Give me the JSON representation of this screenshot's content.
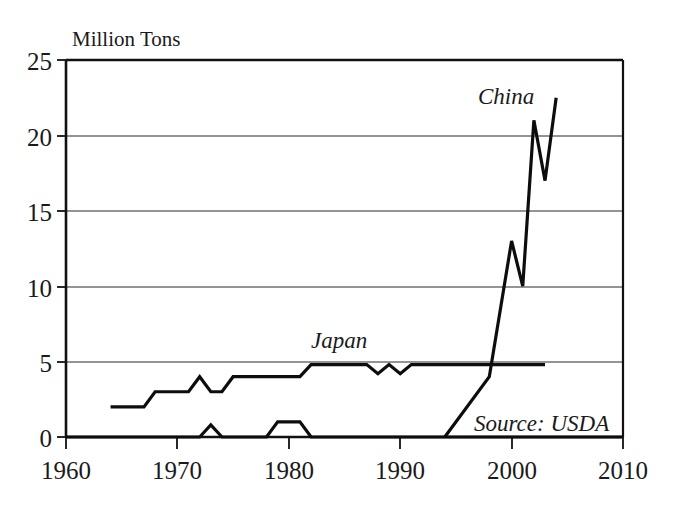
{
  "chart_data": {
    "type": "line",
    "title": "",
    "ylabel": "Million Tons",
    "xlabel": "",
    "xlim": [
      1960,
      2010
    ],
    "ylim": [
      0,
      25
    ],
    "grid": true,
    "legend_position": "inline-labels",
    "x_ticks": [
      "1960",
      "1970",
      "1980",
      "1990",
      "2000",
      "2010"
    ],
    "x_tick_values": [
      1960,
      1970,
      1980,
      1990,
      2000,
      2010
    ],
    "y_ticks": [
      "0",
      "5",
      "10",
      "15",
      "20",
      "25"
    ],
    "y_tick_values": [
      0,
      5,
      10,
      15,
      20,
      25
    ],
    "annotations": [
      {
        "text": "Source: USDA",
        "x": 1995.5,
        "y": 2.0
      }
    ],
    "series": [
      {
        "name": "Japan",
        "label": "Japan",
        "label_x": 1985.0,
        "label_y": 6.3,
        "x": [
          1964,
          1967,
          1968,
          1970,
          1971,
          1972,
          1973,
          1974,
          1975,
          1981,
          1982,
          1987,
          1988,
          1989,
          1990,
          1991,
          2003
        ],
        "values": [
          2.0,
          2.0,
          3.0,
          3.0,
          3.0,
          4.0,
          3.0,
          3.0,
          4.0,
          4.0,
          4.8,
          4.8,
          4.2,
          4.8,
          4.2,
          4.8,
          4.8
        ]
      },
      {
        "name": "Japan-lower",
        "label": "",
        "x": [
          1960,
          1972,
          1973,
          1974,
          1978,
          1979,
          1981,
          1982,
          2010
        ],
        "values": [
          0.0,
          0.0,
          0.8,
          0.0,
          0.0,
          1.0,
          1.0,
          0.0,
          0.0
        ]
      },
      {
        "name": "China",
        "label": "China",
        "label_x": 1998.0,
        "label_y": 22.4,
        "x": [
          1994,
          1998,
          2000,
          2001,
          2002,
          2003,
          2004
        ],
        "values": [
          0.0,
          4.0,
          13.0,
          10.0,
          21.0,
          17.0,
          22.5
        ]
      }
    ]
  },
  "icons": {
    "chart": "line-chart-icon"
  }
}
